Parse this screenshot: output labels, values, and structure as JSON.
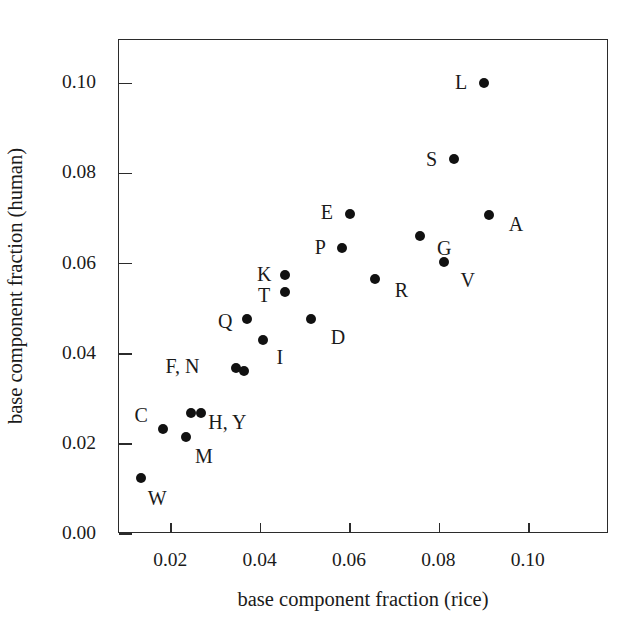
{
  "chart_data": {
    "type": "scatter",
    "title": "",
    "xlabel": "base component fraction (rice)",
    "ylabel": "base component fraction (human)",
    "xlim": [
      0.00832,
      0.11796
    ],
    "ylim": [
      0.0,
      0.10961
    ],
    "xticks": [
      0.02,
      0.04,
      0.06,
      0.08,
      0.1
    ],
    "yticks": [
      0.0,
      0.02,
      0.04,
      0.06,
      0.08,
      0.1
    ],
    "xticklabels": [
      "0.02",
      "0.04",
      "0.06",
      "0.08",
      "0.10"
    ],
    "yticklabels": [
      "0.00",
      "0.02",
      "0.04",
      "0.06",
      "0.08",
      "0.10"
    ],
    "grid": false,
    "legend": false,
    "marker": "filled-circle",
    "marker_color": "#111111",
    "frame_color": "#2b2b2b",
    "background": "#ffffff",
    "points": [
      {
        "label": "W",
        "x": 0.0133,
        "y": 0.0125,
        "label_dx": 16,
        "label_dy": 20
      },
      {
        "label": "C",
        "x": 0.0182,
        "y": 0.0232,
        "label_dx": -22,
        "label_dy": -14
      },
      {
        "label": "M",
        "x": 0.0233,
        "y": 0.0215,
        "label_dx": 18,
        "label_dy": 19
      },
      {
        "label": "H",
        "x": 0.0245,
        "y": 0.0268,
        "label_dx": 36,
        "label_dy": 9
      },
      {
        "label": "Y",
        "x": 0.0267,
        "y": 0.0268,
        "label_dx": 44,
        "label_dy": 9
      },
      {
        "label": "F",
        "x": 0.0346,
        "y": 0.0368,
        "label_dx": -54,
        "label_dy": -2
      },
      {
        "label": "N",
        "x": 0.0362,
        "y": 0.0362,
        "label_dx": -52,
        "label_dy": -2
      },
      {
        "label": "Q",
        "x": 0.037,
        "y": 0.0478,
        "label_dx": -22,
        "label_dy": 2
      },
      {
        "label": "I",
        "x": 0.0405,
        "y": 0.043,
        "label_dx": 17,
        "label_dy": 17
      },
      {
        "label": "T",
        "x": 0.0455,
        "y": 0.0537,
        "label_dx": -21,
        "label_dy": 3
      },
      {
        "label": "K",
        "x": 0.0455,
        "y": 0.0575,
        "label_dx": -21,
        "label_dy": -1
      },
      {
        "label": "D",
        "x": 0.0513,
        "y": 0.0477,
        "label_dx": 27,
        "label_dy": 18
      },
      {
        "label": "P",
        "x": 0.0583,
        "y": 0.0635,
        "label_dx": -22,
        "label_dy": -1
      },
      {
        "label": "E",
        "x": 0.06,
        "y": 0.0709,
        "label_dx": -23,
        "label_dy": -2
      },
      {
        "label": "R",
        "x": 0.0657,
        "y": 0.0566,
        "label_dx": 26,
        "label_dy": 11
      },
      {
        "label": "G",
        "x": 0.0757,
        "y": 0.0661,
        "label_dx": 24,
        "label_dy": 12
      },
      {
        "label": "V",
        "x": 0.081,
        "y": 0.0603,
        "label_dx": 24,
        "label_dy": 18
      },
      {
        "label": "S",
        "x": 0.0832,
        "y": 0.0832,
        "label_dx": -22,
        "label_dy": 0
      },
      {
        "label": "L",
        "x": 0.09,
        "y": 0.1,
        "label_dx": -23,
        "label_dy": -1
      },
      {
        "label": "A",
        "x": 0.0911,
        "y": 0.0707,
        "label_dx": 27,
        "label_dy": 9
      }
    ],
    "combined_label_overrides": [
      {
        "for": [
          "F",
          "N"
        ],
        "text": "F, N"
      },
      {
        "for": [
          "H",
          "Y"
        ],
        "text": "H, Y"
      }
    ]
  },
  "figure": {
    "width": 641,
    "height": 638,
    "plot_left": 118,
    "plot_top": 39,
    "plot_width": 490,
    "plot_height": 494
  }
}
